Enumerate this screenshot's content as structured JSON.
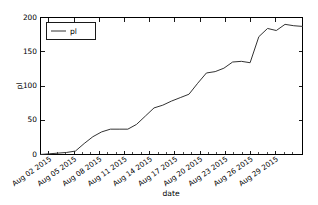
{
  "chart_data": {
    "type": "line",
    "title": "",
    "xlabel": "date",
    "ylabel": "pl",
    "ylim": [
      0,
      200
    ],
    "yticks": [
      0,
      50,
      100,
      150,
      200
    ],
    "ytick_labels": [
      "0",
      "50",
      "100",
      "150",
      "200"
    ],
    "xlim": [
      "Aug 01 2015",
      "Aug 31 2015"
    ],
    "xticks": [
      "Aug 02 2015",
      "Aug 05 2015",
      "Aug 08 2015",
      "Aug 11 2015",
      "Aug 14 2015",
      "Aug 17 2015",
      "Aug 20 2015",
      "Aug 23 2015",
      "Aug 26 2015",
      "Aug 29 2015"
    ],
    "xtick_rotation": -35,
    "grid": false,
    "legend_position": "upper left",
    "series": [
      {
        "name": "pl",
        "color": "#333333",
        "x": [
          "Aug 01",
          "Aug 02",
          "Aug 03",
          "Aug 04",
          "Aug 05",
          "Aug 06",
          "Aug 07",
          "Aug 08",
          "Aug 09",
          "Aug 10",
          "Aug 11",
          "Aug 12",
          "Aug 13",
          "Aug 14",
          "Aug 15",
          "Aug 16",
          "Aug 17",
          "Aug 18",
          "Aug 19",
          "Aug 20",
          "Aug 21",
          "Aug 22",
          "Aug 23",
          "Aug 24",
          "Aug 25",
          "Aug 26",
          "Aug 27",
          "Aug 28",
          "Aug 29",
          "Aug 30",
          "Aug 31"
        ],
        "values": [
          0,
          1,
          2,
          3,
          5,
          16,
          26,
          33,
          37,
          37,
          37,
          44,
          56,
          68,
          72,
          78,
          83,
          88,
          104,
          119,
          121,
          126,
          135,
          136,
          134,
          172,
          184,
          181,
          190,
          188,
          187
        ]
      }
    ],
    "annotations": []
  },
  "legend": {
    "entries": [
      {
        "label": "pl"
      }
    ]
  },
  "axes": {
    "y_label": "pl",
    "x_label": "date"
  }
}
